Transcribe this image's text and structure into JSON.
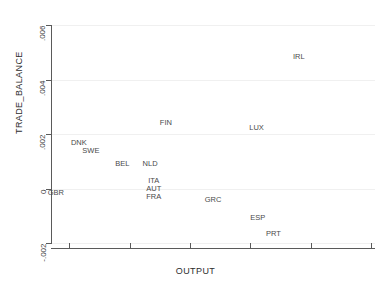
{
  "chart_data": {
    "type": "scatter",
    "title": "",
    "xlabel": "OUTPUT",
    "ylabel": "TRADE_BALANCE",
    "xlim": [
      0.0235,
      0.0503
    ],
    "ylim": [
      -0.002,
      0.006
    ],
    "xticks": [
      ".025",
      ".03",
      ".035",
      ".04",
      ".045",
      ".05"
    ],
    "xtick_values": [
      0.025,
      0.03,
      0.035,
      0.04,
      0.045,
      0.05
    ],
    "yticks": [
      ".006",
      ".004",
      ".002",
      "0",
      "-.002"
    ],
    "ytick_values": [
      0.006,
      0.004,
      0.002,
      0,
      -0.002
    ],
    "grid": true,
    "legend": "none",
    "marker": "text-label",
    "points": [
      {
        "label": "IRL",
        "x": 0.044,
        "y": 0.00485
      },
      {
        "label": "FIN",
        "x": 0.033,
        "y": 0.00243
      },
      {
        "label": "LUX",
        "x": 0.0405,
        "y": 0.00225
      },
      {
        "label": "DNK",
        "x": 0.0258,
        "y": 0.00172
      },
      {
        "label": "SWE",
        "x": 0.0268,
        "y": 0.00143
      },
      {
        "label": "BEL",
        "x": 0.0294,
        "y": 0.00092
      },
      {
        "label": "NLD",
        "x": 0.0317,
        "y": 0.00092
      },
      {
        "label": "ITA",
        "x": 0.032,
        "y": 0.0003
      },
      {
        "label": "AUT",
        "x": 0.032,
        "y": 1e-05
      },
      {
        "label": "FRA",
        "x": 0.032,
        "y": -0.00028
      },
      {
        "label": "GBR",
        "x": 0.0239,
        "y": -0.00014
      },
      {
        "label": "GRC",
        "x": 0.0369,
        "y": -0.0004
      },
      {
        "label": "ESP",
        "x": 0.0406,
        "y": -0.00103
      },
      {
        "label": "PRT",
        "x": 0.0419,
        "y": -0.00165
      }
    ]
  },
  "colors": {
    "axis": "#5a5a5a",
    "grid": "#f0f0f0",
    "label_text": "#4a4a4a",
    "tick_text": "#3c3c3c",
    "background": "#ffffff"
  }
}
